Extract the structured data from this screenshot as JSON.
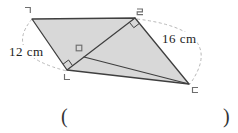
{
  "figure": {
    "vertex_labels": {
      "top_left": "ㄱ",
      "bottom_left": "ㄴ",
      "bottom_right": "ㄷ",
      "top_right": "ㄹ",
      "diagonal_point": "ㅁ"
    },
    "measurements": {
      "left_side": "12 cm",
      "right_side": "16 cm"
    },
    "colors": {
      "shape_fill": "#d8d8d8",
      "shape_stroke": "#3f3f3f",
      "dashed_arc": "#b8b8b8",
      "vertex_label": "#6e6e6e",
      "measurement_text": "#222222",
      "paren_text": "#333333"
    }
  },
  "answer_blank": {
    "open_paren": "(",
    "close_paren": ")"
  }
}
